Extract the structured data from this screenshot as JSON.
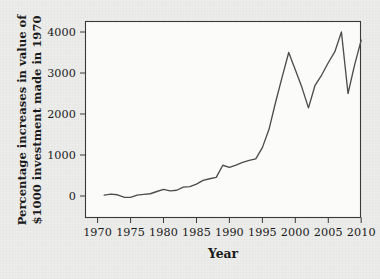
{
  "figure": {
    "background_color": "#ececea",
    "plot_background_color": "#fbfbfa",
    "frame_color": "#3a3a3a"
  },
  "labels": {
    "ylabel_line1": "Percentage increases in value of",
    "ylabel_line2": "$1000 investment made in 1970",
    "xlabel": "Year"
  },
  "axes": {
    "x_ticks": [
      "1970",
      "1975",
      "1980",
      "1985",
      "1990",
      "1995",
      "2000",
      "2005",
      "2010"
    ],
    "y_ticks": [
      "0",
      "1000",
      "2000",
      "3000",
      "4000"
    ]
  },
  "chart_data": {
    "type": "line",
    "title": "",
    "xlabel": "Year",
    "ylabel": "Percentage increases in value of $1000 investment made in 1970",
    "xlim": [
      1969,
      2012
    ],
    "ylim": [
      -180,
      4280
    ],
    "grid": false,
    "legend": null,
    "line_color": "#4d4d4d",
    "line_width": 1.35,
    "x_tick_values": [
      1970,
      1975,
      1980,
      1985,
      1990,
      1995,
      2000,
      2005,
      2010
    ],
    "y_tick_values": [
      0,
      1000,
      2000,
      3000,
      4000
    ],
    "series": [
      {
        "name": "Percentage increase in value of $1000 invested in 1970",
        "x": [
          1971,
          1972,
          1973,
          1974,
          1975,
          1976,
          1977,
          1978,
          1979,
          1980,
          1981,
          1982,
          1983,
          1984,
          1985,
          1986,
          1987,
          1988,
          1989,
          1990,
          1991,
          1992,
          1993,
          1994,
          1995,
          1996,
          1997,
          1998,
          1999,
          2000,
          2001,
          2002,
          2003,
          2004,
          2005,
          2006,
          2007,
          2008,
          2009,
          2010
        ],
        "y": [
          20,
          45,
          30,
          -30,
          -35,
          20,
          40,
          55,
          110,
          160,
          125,
          140,
          215,
          230,
          290,
          380,
          420,
          455,
          750,
          700,
          755,
          820,
          870,
          905,
          1180,
          1620,
          2280,
          2900,
          3500,
          3080,
          2650,
          2150,
          2700,
          2950,
          3250,
          3520,
          4000,
          2500,
          3200,
          3800
        ]
      }
    ]
  }
}
